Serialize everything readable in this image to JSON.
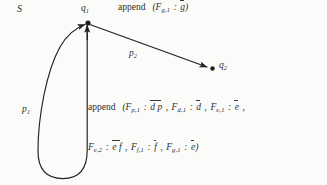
{
  "figure": {
    "kind": "state-transition-diagram",
    "nodes": [
      {
        "id": "q1",
        "label_base": "q",
        "label_sub": "1",
        "x": 88,
        "y": 23
      },
      {
        "id": "q2",
        "label_base": "q",
        "label_sub": "2",
        "x": 210,
        "y": 68
      }
    ],
    "edges": [
      {
        "id": "p1",
        "label_base": "p",
        "label_sub": "1",
        "from": "q1",
        "to": "q1",
        "shape": "self-loop-teardrop"
      },
      {
        "id": "p2",
        "label_base": "p",
        "label_sub": "2",
        "from": "q1",
        "to": "q2",
        "shape": "straight-arrow"
      }
    ],
    "set_label": "S",
    "annotations": {
      "top": {
        "keyword": "append",
        "open": "(",
        "terms": [
          {
            "fn": "F",
            "sub": "g,1",
            "sep": ":",
            "value": "g",
            "overline": true
          }
        ],
        "close": ")"
      },
      "middle": {
        "keyword": "append",
        "open": "(",
        "terms": [
          {
            "fn": "F",
            "sub": "p,1",
            "sep": ":",
            "value": "d p",
            "overline": true
          },
          {
            "fn": "F",
            "sub": "d,1",
            "sep": ":",
            "value": "d",
            "overline": true
          },
          {
            "fn": "F",
            "sub": "e,1",
            "sep": ":",
            "value": "e",
            "overline": true
          }
        ],
        "trailing_comma": ","
      },
      "bottom": {
        "terms": [
          {
            "fn": "F",
            "sub": "e,2",
            "sep": ":",
            "value": "e f",
            "overline": true
          },
          {
            "fn": "F",
            "sub": "f,1",
            "sep": ":",
            "value": "f",
            "overline": true
          },
          {
            "fn": "F",
            "sub": "g,1",
            "sep": ":",
            "value": "e",
            "overline": true
          }
        ],
        "close": ")"
      }
    },
    "colors": {
      "ink": "#2e2e2e",
      "stroke": "#1f1f1f",
      "background": "#fbfbf9"
    }
  }
}
